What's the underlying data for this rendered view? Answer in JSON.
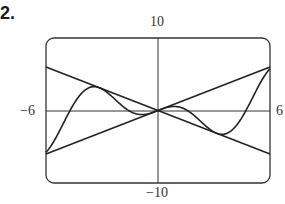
{
  "problem": {
    "number": "2."
  },
  "labels": {
    "ymax": "10",
    "ymin": "−10",
    "xmin": "−6",
    "xmax": "6"
  },
  "chart_data": {
    "type": "line",
    "title": "",
    "xlabel": "",
    "ylabel": "",
    "xlim": [
      -6,
      6
    ],
    "ylim": [
      -10,
      10
    ],
    "grid": false,
    "legend": null,
    "series": [
      {
        "name": "y = x",
        "x": [
          -6,
          6
        ],
        "y": [
          -6,
          6
        ]
      },
      {
        "name": "y = -x",
        "x": [
          -6,
          6
        ],
        "y": [
          6,
          -6
        ]
      },
      {
        "name": "y = x cos x",
        "x": [
          -6,
          -5,
          -4,
          -3.14,
          -2,
          -1,
          0,
          1,
          2,
          3.14,
          4,
          5,
          6
        ],
        "y": [
          -5.76,
          -1.42,
          2.61,
          3.14,
          0.83,
          -0.54,
          0,
          0.54,
          -0.83,
          -3.14,
          -2.61,
          1.42,
          5.76
        ]
      }
    ]
  }
}
